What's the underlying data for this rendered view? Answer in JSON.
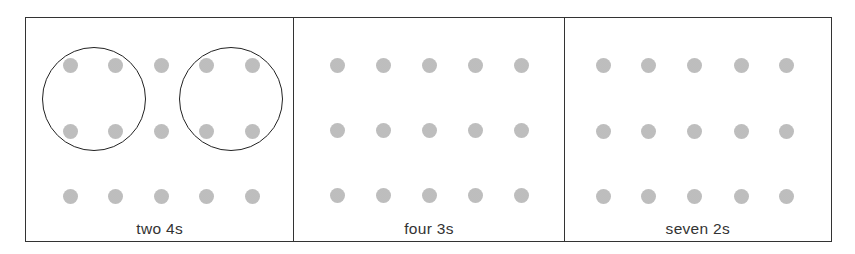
{
  "figure": {
    "dot_color": "#c6c6c6",
    "border_color": "#333333",
    "panels": [
      {
        "label": "two 4s",
        "width": 268,
        "rows": 3,
        "cols": 5,
        "col_x": [
          44,
          89,
          135,
          180,
          226
        ],
        "row_y": [
          47,
          113,
          178
        ],
        "circles": [
          {
            "cx": 68,
            "cy": 81,
            "r": 52
          },
          {
            "cx": 205,
            "cy": 81,
            "r": 52
          }
        ]
      },
      {
        "label": "four 3s",
        "width": 271,
        "rows": 3,
        "cols": 5,
        "col_x": [
          43,
          89,
          135,
          181,
          227
        ],
        "row_y": [
          47,
          112,
          177
        ],
        "circles": []
      },
      {
        "label": "seven 2s",
        "width": 268,
        "rows": 3,
        "cols": 5,
        "col_x": [
          39,
          84,
          130,
          177,
          222
        ],
        "row_y": [
          47,
          113,
          178
        ],
        "circles": []
      }
    ]
  }
}
